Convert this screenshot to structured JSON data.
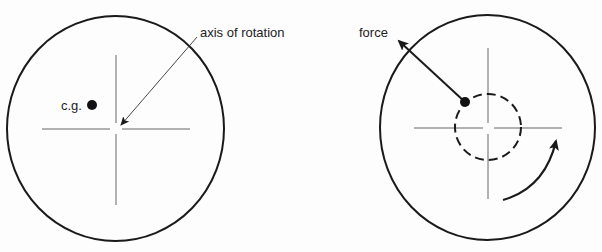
{
  "figure": {
    "left_panel": {
      "labels": {
        "cg": "c.g.",
        "axis": "axis of rotation"
      },
      "disc": {
        "cx": 115.5,
        "cy": 128.5,
        "rx": 108.5,
        "ry": 112.5
      },
      "crosshair": {
        "x": 116,
        "y": 129,
        "x1": 42,
        "x2": 190,
        "y1": 55,
        "y2": 205
      },
      "cg_dot": {
        "cx": 92,
        "cy": 105,
        "r": 5
      }
    },
    "right_panel": {
      "labels": {
        "force": "force"
      },
      "disc": {
        "cx": 487.5,
        "cy": 127.5,
        "rx": 107.5,
        "ry": 112.5
      },
      "crosshair": {
        "x": 488,
        "y": 128,
        "x1": 414,
        "x2": 562,
        "y1": 48,
        "y2": 199
      },
      "orbit_circle": {
        "cx": 488,
        "cy": 127,
        "r": 33,
        "style": "dashed"
      },
      "cg_dot": {
        "cx": 465,
        "cy": 102,
        "r": 5
      },
      "rotation_direction": "counter-clockwise"
    },
    "colors": {
      "ink": "#1a1a1a",
      "thin_line": "#444444",
      "background": "#fdfdfd"
    }
  }
}
